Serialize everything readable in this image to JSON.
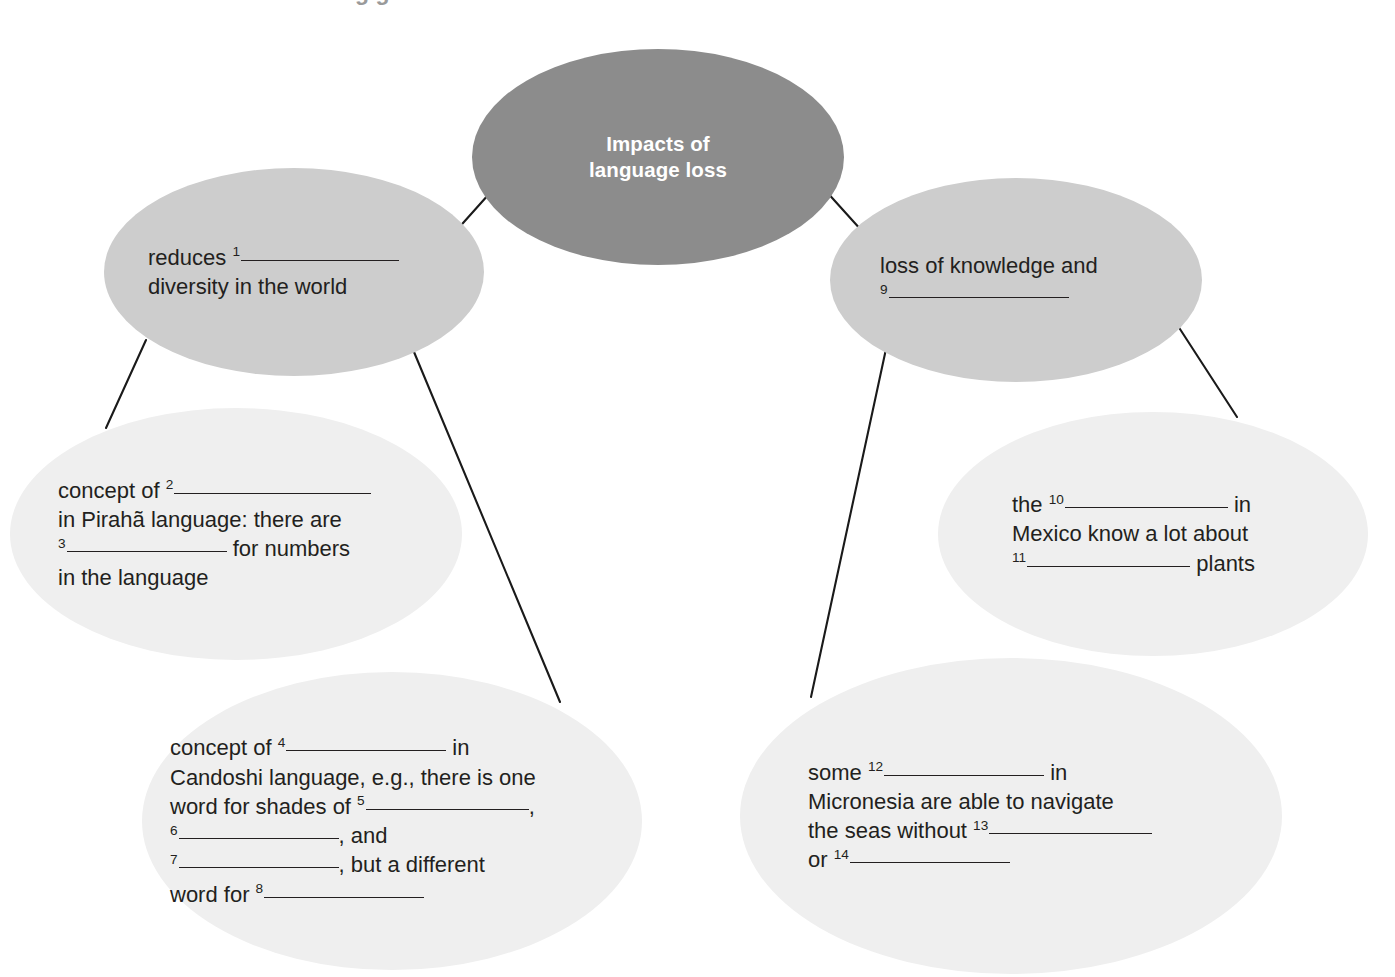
{
  "document": {
    "type": "mind-map",
    "title": "Impacts of language loss",
    "background_color": "#ffffff",
    "text_color": "#231f20",
    "cropped_heading_remnant": "g g"
  },
  "palette": {
    "center_fill": "#8c8c8c",
    "center_text": "#ffffff",
    "branch_fill": "#cdcdcd",
    "detail_fill": "#efefef",
    "connector": "#1a1a1a"
  },
  "nodes": {
    "center": {
      "id": "impacts-of-language-loss",
      "level": 1,
      "lines": [
        "Impacts of",
        "language loss"
      ]
    },
    "branch_left": {
      "id": "reduces-diversity",
      "level": 2,
      "segments": [
        [
          {
            "t": "text",
            "v": "reduces "
          },
          {
            "t": "blank",
            "n": "1",
            "w": 158
          },
          {
            "t": "text",
            "v": ""
          }
        ],
        [
          {
            "t": "text",
            "v": "diversity in the world"
          }
        ]
      ]
    },
    "branch_right": {
      "id": "loss-of-knowledge",
      "level": 2,
      "segments": [
        [
          {
            "t": "text",
            "v": "loss of knowledge and"
          }
        ],
        [
          {
            "t": "blank",
            "n": "9",
            "w": 180
          }
        ]
      ]
    },
    "detail_piraha": {
      "id": "concept-of-piraha",
      "level": 3,
      "segments": [
        [
          {
            "t": "text",
            "v": "concept of "
          },
          {
            "t": "blank",
            "n": "2",
            "w": 197
          }
        ],
        [
          {
            "t": "text",
            "v": "in Pirahã language: there are"
          }
        ],
        [
          {
            "t": "blank",
            "n": "3",
            "w": 160
          },
          {
            "t": "text",
            "v": " for numbers"
          }
        ],
        [
          {
            "t": "text",
            "v": "in the language"
          }
        ]
      ]
    },
    "detail_candoshi": {
      "id": "concept-of-candoshi",
      "level": 3,
      "segments": [
        [
          {
            "t": "text",
            "v": "concept of "
          },
          {
            "t": "blank",
            "n": "4",
            "w": 160
          },
          {
            "t": "text",
            "v": " in"
          }
        ],
        [
          {
            "t": "text",
            "v": "Candoshi language, e.g., there is one"
          }
        ],
        [
          {
            "t": "text",
            "v": "word for shades of "
          },
          {
            "t": "blank",
            "n": "5",
            "w": 163
          },
          {
            "t": "text",
            "v": ","
          }
        ],
        [
          {
            "t": "blank",
            "n": "6",
            "w": 160
          },
          {
            "t": "text",
            "v": ", and"
          }
        ],
        [
          {
            "t": "blank",
            "n": "7",
            "w": 160
          },
          {
            "t": "text",
            "v": ", but a different"
          }
        ],
        [
          {
            "t": "text",
            "v": "word for "
          },
          {
            "t": "blank",
            "n": "8",
            "w": 160
          }
        ]
      ]
    },
    "detail_mexico": {
      "id": "mexico-plants",
      "level": 3,
      "segments": [
        [
          {
            "t": "text",
            "v": "the "
          },
          {
            "t": "blank",
            "n": "10",
            "w": 163
          },
          {
            "t": "text",
            "v": " in"
          }
        ],
        [
          {
            "t": "text",
            "v": "Mexico know a lot about"
          }
        ],
        [
          {
            "t": "blank",
            "n": "11",
            "w": 163
          },
          {
            "t": "text",
            "v": " plants"
          }
        ]
      ]
    },
    "detail_micronesia": {
      "id": "micronesia-navigation",
      "level": 3,
      "segments": [
        [
          {
            "t": "text",
            "v": "some "
          },
          {
            "t": "blank",
            "n": "12",
            "w": 160
          },
          {
            "t": "text",
            "v": " in"
          }
        ],
        [
          {
            "t": "text",
            "v": "Micronesia are able to navigate"
          }
        ],
        [
          {
            "t": "text",
            "v": "the seas without "
          },
          {
            "t": "blank",
            "n": "13",
            "w": 163
          }
        ],
        [
          {
            "t": "text",
            "v": "or "
          },
          {
            "t": "blank",
            "n": "14",
            "w": 160
          }
        ]
      ]
    }
  },
  "connectors": [
    {
      "name": "center-to-left-branch",
      "x1": 489,
      "y1": 194,
      "x2": 455,
      "y2": 232
    },
    {
      "name": "center-to-right-branch",
      "x1": 825,
      "y1": 190,
      "x2": 862,
      "y2": 231
    },
    {
      "name": "left-branch-to-piraha",
      "x1": 146,
      "y1": 340,
      "x2": 106,
      "y2": 428
    },
    {
      "name": "left-branch-to-candoshi",
      "x1": 414,
      "y1": 352,
      "x2": 560,
      "y2": 702
    },
    {
      "name": "right-branch-to-micronesia",
      "x1": 886,
      "y1": 349,
      "x2": 811,
      "y2": 697
    },
    {
      "name": "right-branch-to-mexico",
      "x1": 1178,
      "y1": 326,
      "x2": 1237,
      "y2": 417
    }
  ],
  "geometry": {
    "center": {
      "left": 472,
      "top": 49,
      "width": 372,
      "height": 216,
      "pad_left": 0,
      "pad_right": 0
    },
    "branch_left": {
      "left": 104,
      "top": 168,
      "width": 380,
      "height": 208,
      "pad_left": 44,
      "pad_right": 20
    },
    "branch_right": {
      "left": 830,
      "top": 178,
      "width": 372,
      "height": 204,
      "pad_left": 50,
      "pad_right": 18
    },
    "detail_piraha": {
      "left": 10,
      "top": 408,
      "width": 452,
      "height": 252,
      "pad_left": 48,
      "pad_right": 18
    },
    "detail_candoshi": {
      "left": 142,
      "top": 672,
      "width": 500,
      "height": 298,
      "pad_left": 28,
      "pad_right": 12
    },
    "detail_mexico": {
      "left": 938,
      "top": 412,
      "width": 430,
      "height": 244,
      "pad_left": 74,
      "pad_right": 14
    },
    "detail_micronesia": {
      "left": 740,
      "top": 658,
      "width": 542,
      "height": 316,
      "pad_left": 68,
      "pad_right": 14
    }
  }
}
